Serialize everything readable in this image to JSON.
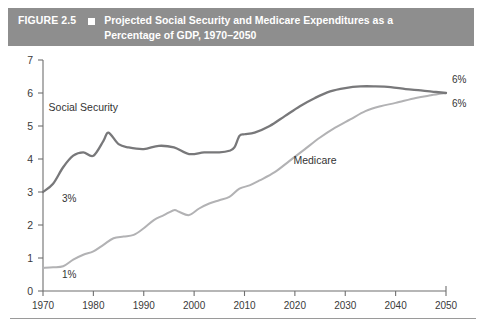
{
  "figure": {
    "label": "FIGURE 2.5",
    "marker_icon": "square-marker-icon",
    "title": "Projected Social Security and Medicare Expenditures as a Percentage of GDP, 1970–2050"
  },
  "chart_data": {
    "type": "line",
    "title": "Projected Social Security and Medicare Expenditures as a Percentage of GDP, 1970–2050",
    "xlabel": "",
    "ylabel": "",
    "xlim": [
      1970,
      2050
    ],
    "ylim": [
      0,
      7
    ],
    "grid": false,
    "legend": "inline-labels",
    "xticks": [
      "1970",
      "1980",
      "1990",
      "2000",
      "2010",
      "2020",
      "2030",
      "2040",
      "2050"
    ],
    "yticks": [
      "0",
      "1",
      "2",
      "3",
      "4",
      "5",
      "6",
      "7"
    ],
    "annotations": [
      {
        "text": "3%",
        "series": "Social Security",
        "x": 1971,
        "y": 3.0
      },
      {
        "text": "1%",
        "series": "Medicare",
        "x": 1971,
        "y": 0.7
      },
      {
        "text": "6%",
        "series": "Social Security",
        "x": 2050,
        "y": 6.0
      },
      {
        "text": "6%",
        "series": "Medicare",
        "x": 2050,
        "y": 6.0
      }
    ],
    "series": [
      {
        "name": "Social Security",
        "color": "#78787a",
        "label_x": 1978,
        "label_y": 5.45,
        "x": [
          1970,
          1972,
          1974,
          1976,
          1978,
          1980,
          1982,
          1983,
          1985,
          1987,
          1990,
          1993,
          1996,
          1999,
          2002,
          2005,
          2007,
          2008,
          2009,
          2010,
          2012,
          2015,
          2018,
          2021,
          2024,
          2027,
          2030,
          2033,
          2036,
          2039,
          2042,
          2045,
          2048,
          2050
        ],
        "y": [
          3.0,
          3.25,
          3.75,
          4.1,
          4.2,
          4.1,
          4.55,
          4.8,
          4.45,
          4.35,
          4.3,
          4.4,
          4.35,
          4.15,
          4.2,
          4.2,
          4.25,
          4.35,
          4.7,
          4.75,
          4.8,
          5.0,
          5.3,
          5.6,
          5.85,
          6.05,
          6.15,
          6.2,
          6.2,
          6.18,
          6.12,
          6.08,
          6.03,
          6.0
        ]
      },
      {
        "name": "Medicare",
        "color": "#b2b2b4",
        "label_x": 2024,
        "label_y": 3.85,
        "x": [
          1970,
          1972,
          1974,
          1976,
          1978,
          1980,
          1982,
          1984,
          1986,
          1988,
          1990,
          1992,
          1994,
          1996,
          1997,
          1999,
          2001,
          2003,
          2005,
          2007,
          2009,
          2011,
          2013,
          2016,
          2019,
          2022,
          2025,
          2028,
          2031,
          2034,
          2037,
          2040,
          2044,
          2047,
          2050
        ],
        "y": [
          0.7,
          0.72,
          0.75,
          0.95,
          1.1,
          1.2,
          1.4,
          1.6,
          1.65,
          1.7,
          1.9,
          2.15,
          2.3,
          2.45,
          2.4,
          2.3,
          2.5,
          2.65,
          2.75,
          2.85,
          3.1,
          3.2,
          3.35,
          3.6,
          3.95,
          4.3,
          4.65,
          4.95,
          5.2,
          5.45,
          5.6,
          5.7,
          5.85,
          5.93,
          6.0
        ]
      }
    ]
  },
  "colors": {
    "header_bar": "#8e8e8e",
    "header_text": "#ffffff",
    "social_security_line": "#78787a",
    "medicare_line": "#b2b2b4",
    "axis": "#6f6f6f"
  }
}
